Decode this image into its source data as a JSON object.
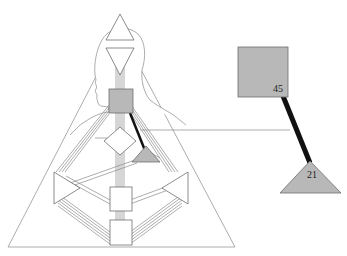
{
  "diagram": {
    "type": "bodygraph",
    "colors": {
      "defined_fill": "#b8b8b8",
      "outline": "#6f6f6f",
      "channel_line": "#8a8a8a",
      "active_channel": "#111111",
      "background": "#ffffff"
    },
    "centers": [
      {
        "id": "head",
        "shape": "triangle-up",
        "defined": false
      },
      {
        "id": "ajna",
        "shape": "triangle-down",
        "defined": false
      },
      {
        "id": "throat",
        "shape": "square",
        "defined": true
      },
      {
        "id": "g",
        "shape": "diamond",
        "defined": false
      },
      {
        "id": "heart",
        "shape": "triangle",
        "defined": true
      },
      {
        "id": "spleen",
        "shape": "triangle-right",
        "defined": false
      },
      {
        "id": "solar-plexus",
        "shape": "triangle-left",
        "defined": false
      },
      {
        "id": "sacral",
        "shape": "square",
        "defined": false
      },
      {
        "id": "root",
        "shape": "square",
        "defined": false
      }
    ],
    "detail": {
      "upper_center": {
        "gate": "45"
      },
      "lower_center": {
        "gate": "21"
      },
      "channel": "21-45"
    }
  }
}
